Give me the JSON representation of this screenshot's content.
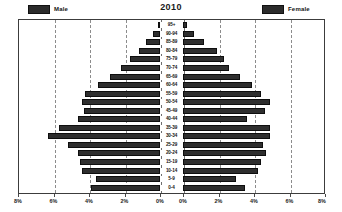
{
  "header": {
    "title": "2010",
    "legend": [
      {
        "label": "Male",
        "swatch_color": "#2b2b2b",
        "side": "left"
      },
      {
        "label": "Female",
        "swatch_color": "#2b2b2b",
        "side": "right"
      }
    ]
  },
  "axis": {
    "left_tick_labels": [
      "8%",
      "6%",
      "4%",
      "2%",
      "0%"
    ],
    "right_tick_labels": [
      "0%",
      "2%",
      "4%",
      "6%",
      "8%"
    ],
    "tick_values": [
      8,
      6,
      4,
      2,
      0,
      0,
      2,
      4,
      6,
      8
    ],
    "max_percent": 8,
    "grid": "dashed-vertical"
  },
  "colors": {
    "bar": "#2e2e2e",
    "bar_border": "#0e0e0e",
    "grid": "#8c8c8c",
    "frame": "#3c3c3c",
    "text": "#141414",
    "background": "#ffffff"
  },
  "chart_data": {
    "type": "bar",
    "subtype": "population-pyramid",
    "title": "2010",
    "xlabel": "",
    "ylabel": "",
    "xlim": [
      -8,
      8
    ],
    "grid": true,
    "legend_position": "top",
    "categories": [
      "95+",
      "90-94",
      "85-89",
      "80-84",
      "75-79",
      "70-74",
      "65-69",
      "60-64",
      "55-59",
      "50-54",
      "45-49",
      "40-44",
      "35-39",
      "30-34",
      "25-29",
      "20-24",
      "15-19",
      "10-14",
      "5-9",
      "0-4"
    ],
    "series": [
      {
        "name": "Male",
        "side": "left",
        "unit": "%",
        "values": [
          0.1,
          0.4,
          0.8,
          1.2,
          1.7,
          2.2,
          2.8,
          3.5,
          4.2,
          4.4,
          4.3,
          4.6,
          5.7,
          6.3,
          5.2,
          4.6,
          4.5,
          4.4,
          3.6,
          3.9
        ]
      },
      {
        "name": "Female",
        "side": "right",
        "unit": "%",
        "values": [
          0.2,
          0.6,
          1.2,
          1.9,
          2.3,
          2.6,
          3.2,
          3.9,
          4.4,
          4.9,
          4.6,
          3.6,
          4.9,
          4.9,
          4.5,
          4.7,
          4.4,
          4.2,
          3.0,
          3.5
        ]
      }
    ]
  }
}
